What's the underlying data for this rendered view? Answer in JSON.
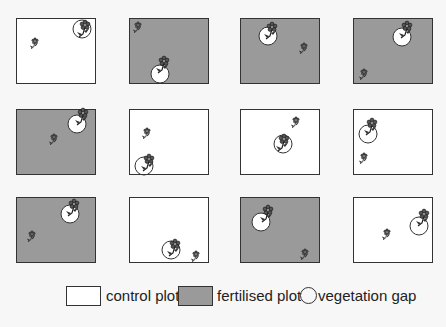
{
  "colors": {
    "control_fill": "#ffffff",
    "fertilised_fill": "#9a9a9a",
    "border": "#333333"
  },
  "plots": [
    {
      "row": 0,
      "col": 0,
      "type": "control",
      "x": 16,
      "y": 18,
      "gap": {
        "cx": 65,
        "cy": 10,
        "r": 9
      },
      "big_flower": {
        "x": 68,
        "y": 6
      },
      "small_flower": {
        "x": 18,
        "y": 22
      }
    },
    {
      "row": 0,
      "col": 1,
      "type": "fertilised",
      "x": 129,
      "y": 18,
      "gap": {
        "cx": 30,
        "cy": 55,
        "r": 9
      },
      "big_flower": {
        "x": 34,
        "y": 42
      },
      "small_flower": {
        "x": 8,
        "y": 6
      }
    },
    {
      "row": 0,
      "col": 2,
      "type": "fertilised",
      "x": 240,
      "y": 18,
      "gap": {
        "cx": 27,
        "cy": 17,
        "r": 9
      },
      "big_flower": {
        "x": 31,
        "y": 8
      },
      "small_flower": {
        "x": 63,
        "y": 27
      }
    },
    {
      "row": 0,
      "col": 3,
      "type": "fertilised",
      "x": 353,
      "y": 18,
      "gap": {
        "cx": 48,
        "cy": 18,
        "r": 9
      },
      "big_flower": {
        "x": 53,
        "y": 7
      },
      "small_flower": {
        "x": 10,
        "y": 53
      }
    },
    {
      "row": 1,
      "col": 0,
      "type": "fertilised",
      "x": 16,
      "y": 109,
      "gap": {
        "cx": 60,
        "cy": 14,
        "r": 9
      },
      "big_flower": {
        "x": 66,
        "y": 3
      },
      "small_flower": {
        "x": 37,
        "y": 27
      }
    },
    {
      "row": 1,
      "col": 1,
      "type": "control",
      "x": 129,
      "y": 109,
      "gap": {
        "cx": 14,
        "cy": 56,
        "r": 9
      },
      "big_flower": {
        "x": 19,
        "y": 49
      },
      "small_flower": {
        "x": 17,
        "y": 21
      }
    },
    {
      "row": 1,
      "col": 2,
      "type": "control",
      "x": 240,
      "y": 109,
      "gap": {
        "cx": 42,
        "cy": 34,
        "r": 9
      },
      "big_flower": {
        "x": 43,
        "y": 29
      },
      "small_flower": {
        "x": 55,
        "y": 10
      }
    },
    {
      "row": 1,
      "col": 3,
      "type": "control",
      "x": 353,
      "y": 109,
      "gap": {
        "cx": 14,
        "cy": 24,
        "r": 9
      },
      "big_flower": {
        "x": 18,
        "y": 13
      },
      "small_flower": {
        "x": 10,
        "y": 46
      }
    },
    {
      "row": 2,
      "col": 0,
      "type": "fertilised",
      "x": 16,
      "y": 197,
      "gap": {
        "cx": 53,
        "cy": 16,
        "r": 9
      },
      "big_flower": {
        "x": 57,
        "y": 6
      },
      "small_flower": {
        "x": 15,
        "y": 36
      }
    },
    {
      "row": 2,
      "col": 1,
      "type": "control",
      "x": 129,
      "y": 197,
      "gap": {
        "cx": 41,
        "cy": 52,
        "r": 9
      },
      "big_flower": {
        "x": 45,
        "y": 46
      },
      "small_flower": {
        "x": 66,
        "y": 56
      }
    },
    {
      "row": 2,
      "col": 2,
      "type": "fertilised",
      "x": 240,
      "y": 197,
      "gap": {
        "cx": 20,
        "cy": 24,
        "r": 9
      },
      "big_flower": {
        "x": 27,
        "y": 12
      },
      "small_flower": {
        "x": 64,
        "y": 54
      }
    },
    {
      "row": 2,
      "col": 3,
      "type": "control",
      "x": 353,
      "y": 197,
      "gap": {
        "cx": 65,
        "cy": 28,
        "r": 9
      },
      "big_flower": {
        "x": 70,
        "y": 16
      },
      "small_flower": {
        "x": 33,
        "y": 34
      }
    }
  ],
  "legend": {
    "items": [
      {
        "name": "control",
        "label": "control plot"
      },
      {
        "name": "fertilised",
        "label": "fertilised plot"
      },
      {
        "name": "gap",
        "label": "vegetation gap"
      }
    ]
  },
  "icons": {
    "flower": "flower-icon",
    "gap": "vegetation-gap-circle-icon"
  }
}
